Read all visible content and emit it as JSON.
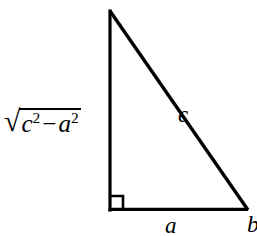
{
  "figure": {
    "type": "right-triangle-geometry-diagram",
    "background_color": "#ffffff",
    "stroke_color": "#000000",
    "labels": {
      "hypotenuse": "c",
      "base": "a",
      "vertex_right": "b",
      "vertical_leg": {
        "full_text": "√(c² − a²)",
        "radical_sign": "√",
        "first_term": "c",
        "first_exponent": "2",
        "operator": "−",
        "second_term": "a",
        "second_exponent": "2"
      }
    },
    "right_angle_marker": "square",
    "vertices": {
      "apex": [
        110,
        12
      ],
      "bottom_left": [
        110,
        210
      ],
      "bottom_right": [
        247,
        210
      ]
    }
  }
}
